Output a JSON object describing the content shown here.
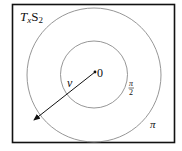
{
  "diagram": {
    "title_label": {
      "main": "T",
      "sub1": "x",
      "main2": "S",
      "sub2": "2"
    },
    "origin_label": "0",
    "vector_label": "v",
    "inner_circle_label": {
      "numerator": "π",
      "denominator": "2"
    },
    "outer_circle_label": "π",
    "colors": {
      "frame": "#111111",
      "circle": "#888888",
      "arrow": "#111111"
    },
    "shapes": {
      "frame": {
        "x": 12,
        "y": 4,
        "width": 163,
        "height": 139
      },
      "center": {
        "x": 94,
        "y": 74
      },
      "inner_radius": 33,
      "outer_radius": 66,
      "arrow_end": {
        "x": 33,
        "y": 121
      }
    }
  }
}
